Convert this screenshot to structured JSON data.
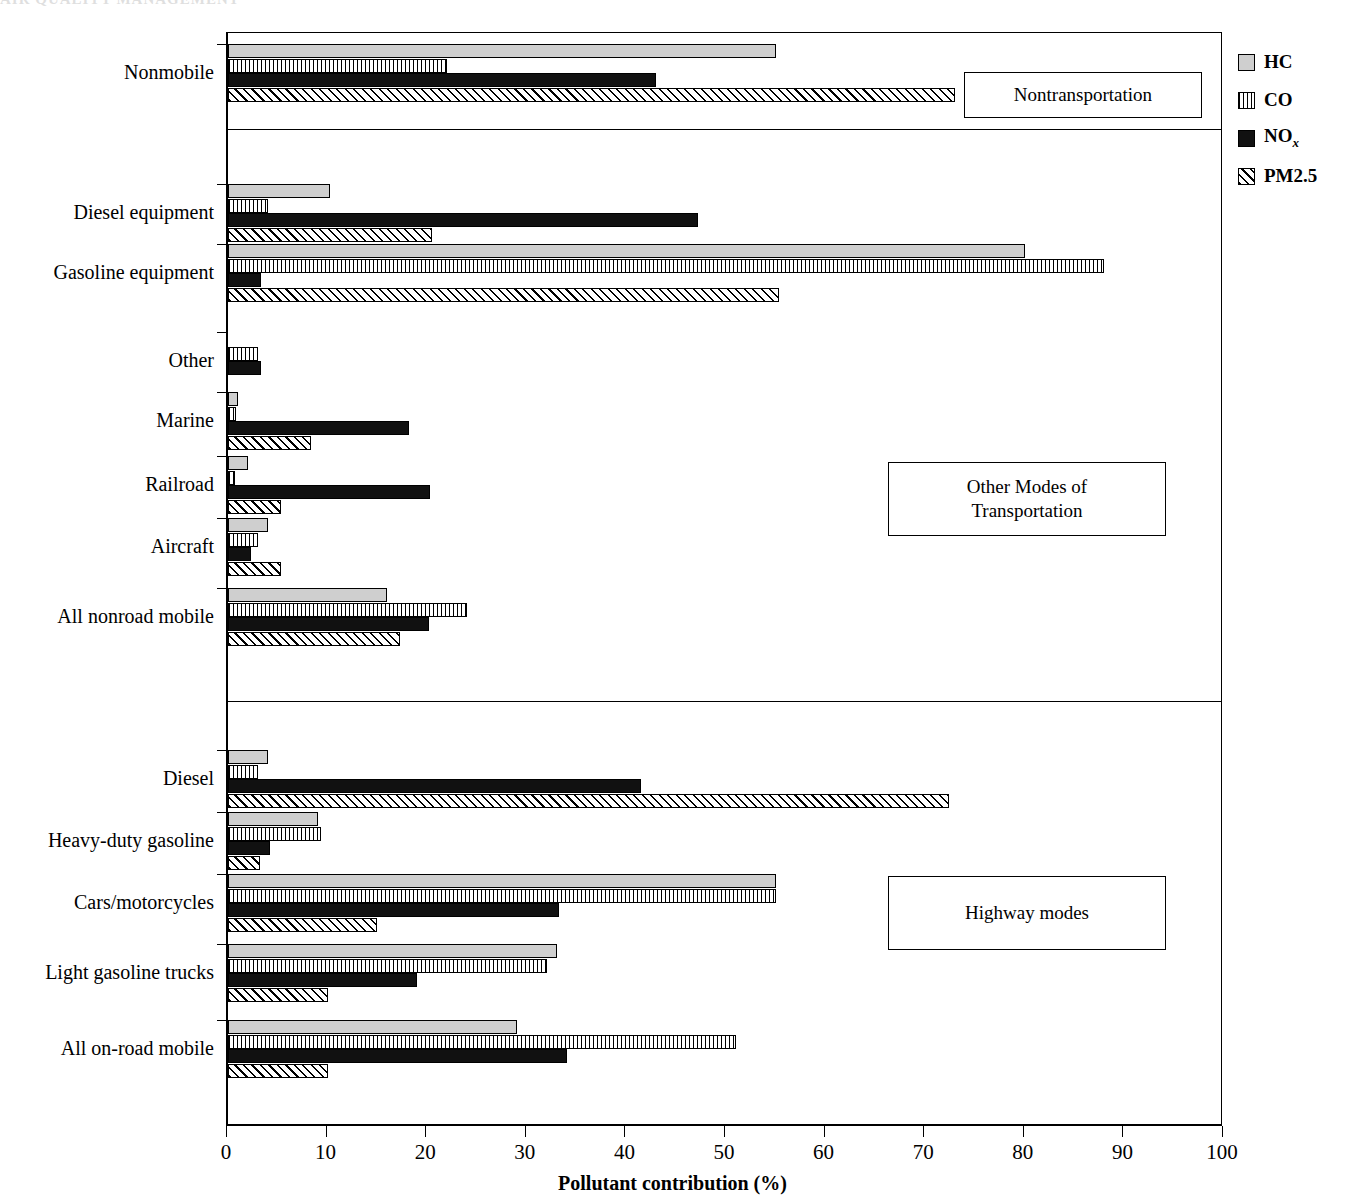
{
  "header_fragment": "AIR QUALITY MANAGEMENT",
  "chart_data": {
    "type": "bar",
    "orientation": "horizontal",
    "title": "",
    "xlabel": "Pollutant contribution (%)",
    "ylabel": "",
    "xlim": [
      0,
      100
    ],
    "xticks": [
      0,
      10,
      20,
      30,
      40,
      50,
      60,
      70,
      80,
      90,
      100
    ],
    "grid": false,
    "legend_position": "right",
    "categories": [
      "Nonmobile",
      "Diesel equipment",
      "Gasoline equipment",
      "Other",
      "Marine",
      "Railroad",
      "Aircraft",
      "All nonroad mobile",
      "Diesel",
      "Heavy-duty gasoline",
      "Cars/motorcycles",
      "Light gasoline trucks",
      "All on-road mobile"
    ],
    "series": [
      {
        "name": "HC",
        "values": [
          55.0,
          10.2,
          80.0,
          0.0,
          1.0,
          2.0,
          4.0,
          16.0,
          4.0,
          9.0,
          55.0,
          33.0,
          29.0
        ]
      },
      {
        "name": "CO",
        "values": [
          22.0,
          4.0,
          88.0,
          3.0,
          0.8,
          0.7,
          3.0,
          24.0,
          3.0,
          9.3,
          55.0,
          32.0,
          51.0
        ]
      },
      {
        "name": "NOx",
        "values": [
          43.0,
          47.2,
          3.3,
          3.3,
          18.2,
          20.3,
          2.3,
          20.2,
          41.5,
          4.2,
          33.2,
          19.0,
          34.0
        ]
      },
      {
        "name": "PM2.5",
        "values": [
          73.0,
          20.5,
          55.3,
          0.0,
          8.3,
          5.3,
          5.3,
          17.3,
          72.4,
          3.2,
          15.0,
          10.0,
          10.0
        ]
      }
    ],
    "group_separators_after": [
      "Nonmobile",
      "All nonroad mobile"
    ],
    "annotations": [
      {
        "text": "Nontransportation"
      },
      {
        "text": "Other Modes of\nTransportation"
      },
      {
        "text": "Highway modes"
      }
    ]
  },
  "legend": [
    {
      "label": "HC",
      "pattern": "solid-light-gray"
    },
    {
      "label": "CO",
      "pattern": "vertical-lines"
    },
    {
      "label": "NOx",
      "pattern": "solid-black"
    },
    {
      "label": "PM2.5",
      "pattern": "diagonal-hatch"
    }
  ],
  "legend_nox": {
    "base": "NO",
    "sub": "x"
  },
  "annotation_boxes": [
    {
      "text": "Nontransportation"
    },
    {
      "line1": "Other Modes of",
      "line2": "Transportation"
    },
    {
      "text": "Highway modes"
    }
  ]
}
